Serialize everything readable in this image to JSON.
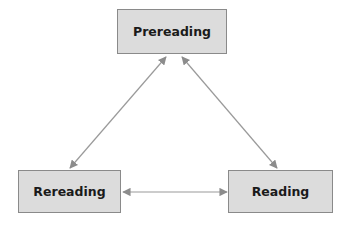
{
  "diagram": {
    "type": "cycle",
    "nodes": [
      {
        "id": "prereading",
        "label": "Prereading"
      },
      {
        "id": "rereading",
        "label": "Rereading"
      },
      {
        "id": "reading",
        "label": "Reading"
      }
    ],
    "edges": [
      {
        "from": "prereading",
        "to": "rereading",
        "bidirectional": true
      },
      {
        "from": "prereading",
        "to": "reading",
        "bidirectional": true
      },
      {
        "from": "rereading",
        "to": "reading",
        "bidirectional": true
      }
    ],
    "colors": {
      "node_fill": "#dcdcdc",
      "node_border": "#8a8a8a",
      "arrow": "#8c8c8c"
    }
  }
}
